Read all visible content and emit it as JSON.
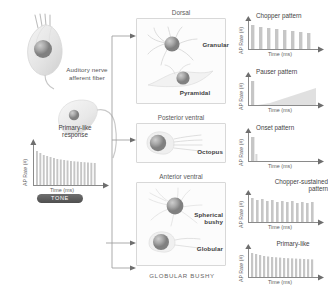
{
  "figure": {
    "bottom_caption": "GLOBULAR BUSHY"
  },
  "input": {
    "hair_cell_name": "hair-cell",
    "nerve_label_line1": "Auditory nerve",
    "nerve_label_line2": "afferent fiber",
    "response_label_line1": "Primary-like",
    "response_label_line2": "response",
    "plot": {
      "ylabel": "AP Rate (#)",
      "xlabel": "Time (ms)"
    },
    "tone_label": "TONE"
  },
  "regions": [
    {
      "title": "Dorsal",
      "cells": [
        {
          "label": "Granular"
        },
        {
          "label": "Pyramidal"
        }
      ]
    },
    {
      "title": "Posterior ventral",
      "cells": [
        {
          "label": "Octopus"
        }
      ]
    },
    {
      "title": "Anterior ventral",
      "cells": [
        {
          "label": "Spherical bushy"
        },
        {
          "label": "Globular"
        }
      ]
    }
  ],
  "responses": [
    {
      "title": "Chopper pattern",
      "ylabel": "AP Rate (#)",
      "xlabel": "Time (ms)"
    },
    {
      "title": "Pauser pattern",
      "ylabel": "AP Rate (#)",
      "xlabel": "Time (ms)"
    },
    {
      "title": "Onset pattern",
      "ylabel": "AP Rate (#)",
      "xlabel": "Time (ms)"
    },
    {
      "title": "Chopper-sustained pattern",
      "ylabel": "AP Rate (#)",
      "xlabel": "Time (ms)"
    },
    {
      "title": "Primary-like",
      "ylabel": "AP Rate (#)",
      "xlabel": "Time (ms)"
    }
  ],
  "colors": {
    "ink": "#4a4a4a",
    "box_border": "#d8d8d8",
    "bar": "#c2c2c2",
    "axis": "#8a8a8a",
    "tone_bg": "#5a5a5a"
  }
}
